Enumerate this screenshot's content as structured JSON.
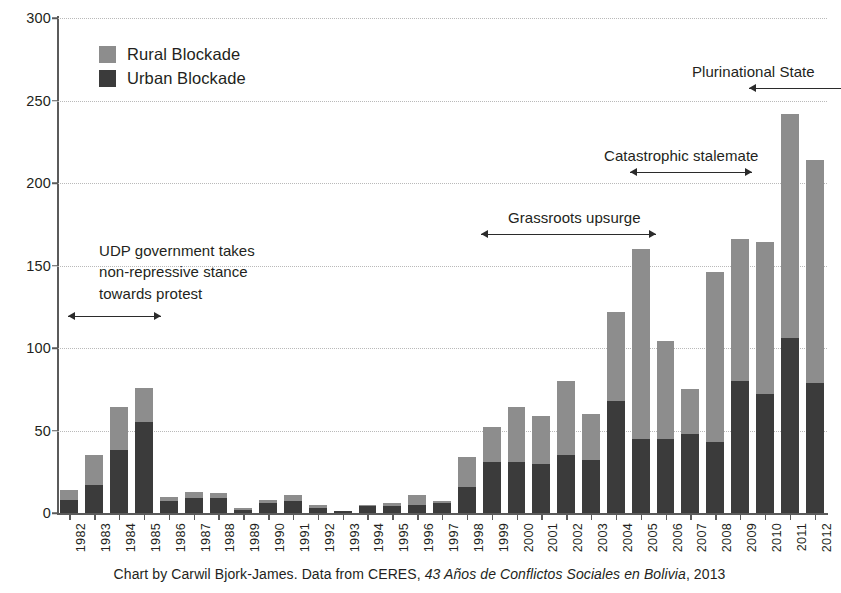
{
  "chart_data": {
    "type": "bar",
    "stacked": true,
    "title": "",
    "subtitle": "",
    "xlabel": "",
    "ylabel": "",
    "ylim": [
      0,
      300
    ],
    "ytick_labels": [
      "0",
      "50",
      "100",
      "150",
      "200",
      "250",
      "300"
    ],
    "ytick_values": [
      0,
      50,
      100,
      150,
      200,
      250,
      300
    ],
    "grid": "horizontal-dotted",
    "legend_position": "top-left-inside",
    "categories": [
      "1982",
      "1983",
      "1984",
      "1985",
      "1986",
      "1987",
      "1988",
      "1989",
      "1990",
      "1991",
      "1992",
      "1993",
      "1994",
      "1995",
      "1996",
      "1997",
      "1998",
      "1999",
      "2000",
      "2001",
      "2002",
      "2003",
      "2004",
      "2005",
      "2006",
      "2007",
      "2008",
      "2009",
      "2010",
      "2011",
      "2012"
    ],
    "series": [
      {
        "name": "Urban Blockade",
        "color": "#3b3b3b",
        "values": [
          8,
          17,
          38,
          55,
          7,
          9,
          9,
          2,
          6,
          7,
          3,
          1,
          4,
          4,
          5,
          6,
          16,
          31,
          31,
          30,
          35,
          32,
          68,
          45,
          45,
          48,
          43,
          80,
          72,
          106,
          79
        ]
      },
      {
        "name": "Rural Blockade",
        "color": "#8d8d8d",
        "values": [
          6,
          18,
          26,
          21,
          3,
          4,
          3,
          1,
          2,
          4,
          2,
          0,
          1,
          2,
          6,
          1,
          18,
          21,
          33,
          29,
          45,
          28,
          54,
          115,
          59,
          27,
          103,
          86,
          92,
          136,
          135
        ]
      }
    ],
    "totals": [
      14,
      35,
      64,
      76,
      10,
      13,
      12,
      3,
      8,
      11,
      5,
      1,
      5,
      6,
      11,
      7,
      34,
      52,
      64,
      59,
      80,
      60,
      122,
      160,
      104,
      75,
      146,
      166,
      164,
      242,
      214
    ],
    "annotations": [
      {
        "id": "udp-government",
        "lines": [
          "UDP government takes",
          "non-repressive stance",
          "towards protest"
        ],
        "bracket_from": "1982",
        "bracket_to": "1985"
      },
      {
        "id": "grassroots-upsurge",
        "lines": [
          "Grassroots upsurge"
        ],
        "bracket_from": "2000",
        "bracket_to": "2005"
      },
      {
        "id": "catastrophic-stalemate",
        "lines": [
          "Catastrophic stalemate"
        ],
        "bracket_from": "2005",
        "bracket_to": "2009"
      },
      {
        "id": "plurinational-state",
        "lines": [
          "Plurinational State"
        ],
        "bracket_from": "2009",
        "bracket_to": "2012"
      }
    ]
  },
  "legend": {
    "items": [
      {
        "label": "Rural Blockade",
        "color": "#8d8d8d"
      },
      {
        "label": "Urban Blockade",
        "color": "#3b3b3b"
      }
    ]
  },
  "annotations": {
    "udp_line1": "UDP government takes",
    "udp_line2": "non-repressive stance",
    "udp_line3": "towards protest",
    "grassroots": "Grassroots upsurge",
    "catastrophic": "Catastrophic stalemate",
    "plurinational": "Plurinational State"
  },
  "caption": {
    "prefix": "Chart by Carwil Bjork-James. Data from CERES, ",
    "source_title": "43 Años de Conflictos Sociales en Bolivia",
    "suffix": ", 2013"
  },
  "colors": {
    "rural": "#8d8d8d",
    "urban": "#3b3b3b",
    "axis": "#5b5b5b",
    "grid": "#b9b9b9",
    "text": "#231f20",
    "background": "#ffffff"
  }
}
